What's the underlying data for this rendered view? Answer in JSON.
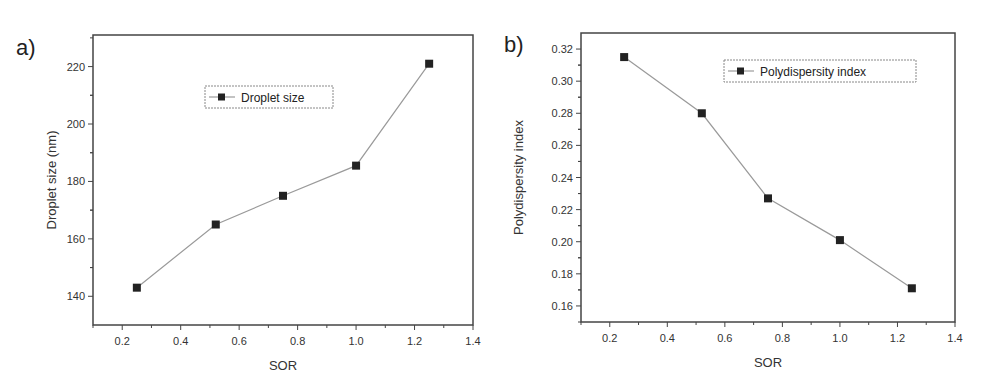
{
  "panels": [
    {
      "label": "a)"
    },
    {
      "label": "b)"
    }
  ],
  "chart_data": [
    {
      "type": "line",
      "panel": "a)",
      "title": "",
      "xlabel": "SOR",
      "ylabel": "Droplet size (nm)",
      "xlim": [
        0.1,
        1.4
      ],
      "ylim": [
        130,
        231
      ],
      "xticks": [
        "0.2",
        "0.4",
        "0.6",
        "0.8",
        "1.0",
        "1.2",
        "1.4"
      ],
      "yticks": [
        "140",
        "160",
        "180",
        "200",
        "220"
      ],
      "grid": false,
      "legend_position": "upper center",
      "series": [
        {
          "name": "Droplet size",
          "marker": "square",
          "x": [
            0.25,
            0.52,
            0.75,
            1.0,
            1.25
          ],
          "values": [
            143,
            165,
            175,
            185.5,
            221
          ]
        }
      ]
    },
    {
      "type": "line",
      "panel": "b)",
      "title": "",
      "xlabel": "SOR",
      "ylabel": "Polydispersity index",
      "xlim": [
        0.1,
        1.4
      ],
      "ylim": [
        0.15,
        0.33
      ],
      "xticks": [
        "0.2",
        "0.4",
        "0.6",
        "0.8",
        "1.0",
        "1.2",
        "1.4"
      ],
      "yticks": [
        "0.16",
        "0.18",
        "0.20",
        "0.22",
        "0.24",
        "0.26",
        "0.28",
        "0.30",
        "0.32"
      ],
      "grid": false,
      "legend_position": "upper right",
      "series": [
        {
          "name": "Polydispersity index",
          "marker": "square",
          "x": [
            0.25,
            0.52,
            0.75,
            1.0,
            1.25
          ],
          "values": [
            0.315,
            0.28,
            0.227,
            0.201,
            0.171
          ]
        }
      ]
    }
  ],
  "colors": {
    "line": "#9a9a9a",
    "marker": "#222222",
    "axis": "#444444"
  }
}
